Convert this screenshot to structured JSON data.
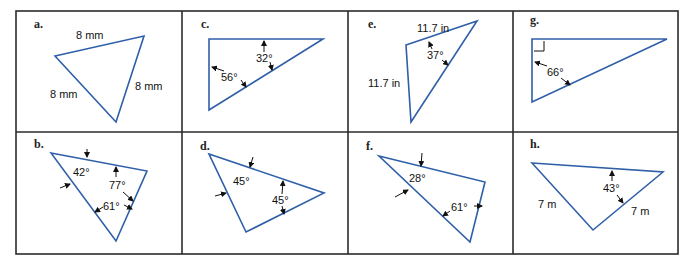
{
  "figure": {
    "panels": [
      {
        "id": "a",
        "label": "a.",
        "annotations": [
          "8 mm",
          "8 mm",
          "8 mm"
        ]
      },
      {
        "id": "c",
        "label": "c.",
        "annotations": [
          "32°",
          "56°"
        ]
      },
      {
        "id": "e",
        "label": "e.",
        "annotations": [
          "11.7 in",
          "11.7 in",
          "37°"
        ]
      },
      {
        "id": "g",
        "label": "g.",
        "annotations": [
          "66°"
        ],
        "right_angle_marker": true
      },
      {
        "id": "b",
        "label": "b.",
        "annotations": [
          "42°",
          "77°",
          "61°"
        ]
      },
      {
        "id": "d",
        "label": "d.",
        "annotations": [
          "45°",
          "45°"
        ]
      },
      {
        "id": "f",
        "label": "f.",
        "annotations": [
          "28°",
          "61°"
        ]
      },
      {
        "id": "h",
        "label": "h.",
        "annotations": [
          "43°",
          "7 m",
          "7 m"
        ]
      }
    ],
    "colors": {
      "triangle": "#2f5fa8",
      "frame": "#2b2b2b",
      "text": "#111111"
    }
  }
}
